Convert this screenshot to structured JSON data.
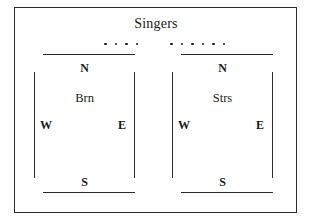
{
  "diagram": {
    "title": "Singers",
    "frame": {
      "name": "outer-border"
    },
    "dot_groups": [
      {
        "name": "singers-row-left",
        "count": 4,
        "marker": "dot"
      },
      {
        "name": "singers-row-right",
        "count": 6,
        "marker": "dot"
      }
    ],
    "sections": [
      {
        "id": "brn",
        "label": "Brn",
        "compass": {
          "north": "N",
          "south": "S",
          "west": "W",
          "east": "E"
        }
      },
      {
        "id": "strs",
        "label": "Strs",
        "compass": {
          "north": "N",
          "south": "S",
          "west": "W",
          "east": "E"
        }
      }
    ],
    "colors": {
      "ink": "#1a1a1a",
      "line": "#2b2b2b",
      "background": "#ffffff"
    }
  }
}
